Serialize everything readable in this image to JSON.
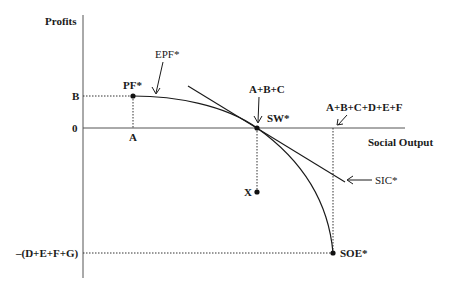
{
  "axes": {
    "y_label": "Profits",
    "x_label": "Social Output"
  },
  "y_ticks": {
    "b": "B",
    "zero": "0",
    "neg": "–(D+E+F+G)"
  },
  "x_ticks": {
    "a": "A"
  },
  "points": {
    "pf": "PF*",
    "sw": "SW*",
    "soe": "SOE*",
    "x": "X"
  },
  "annotations": {
    "epf": "EPF*",
    "abc": "A+B+C",
    "abcdef": "A+B+C+D+E+F",
    "sic": "SIC*"
  },
  "colors": {
    "line": "#1a1a1a",
    "axis": "#555555",
    "background": "#ffffff"
  }
}
